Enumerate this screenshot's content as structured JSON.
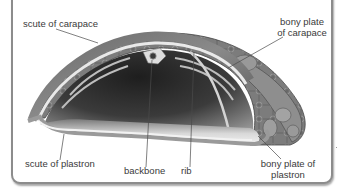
{
  "diagram": {
    "labels": {
      "scute_of_carapace": "scute of carapace",
      "bony_plate_of_carapace_line1": "bony plate",
      "bony_plate_of_carapace_line2": "of carapace",
      "scute_of_plastron": "scute of plastron",
      "backbone": "backbone",
      "rib": "rib",
      "bony_plate_of_plastron_line1": "bony plate of",
      "bony_plate_of_plastron_line2": "plastron"
    },
    "colors": {
      "frame_border": "#8c8c8c",
      "label_text": "#3a3a3a",
      "leader_line": "#4a4a4a",
      "shell_dark": "#4d4d4d",
      "shell_mid": "#8a8a8a",
      "bone_light": "#e8e8e8",
      "interior_dark": "#2b2b2b"
    }
  }
}
